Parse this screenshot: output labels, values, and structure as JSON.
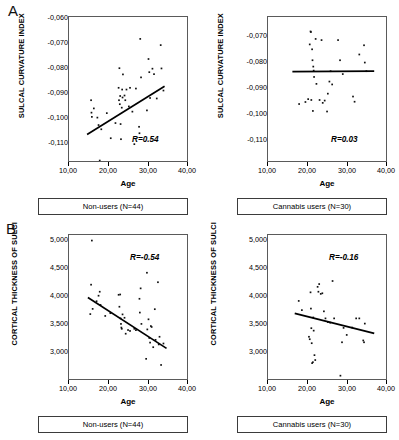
{
  "figure": {
    "panels": [
      {
        "letter": "A",
        "plots": [
          {
            "name": "sulcal-curvature-nonusers",
            "ylabel": "SULCAL CURVATURE INDEX",
            "xlabel": "Age",
            "yticks": [
              "-0,060",
              "-0,070",
              "-0,080",
              "-0,090",
              "-0,100",
              "-0,110"
            ],
            "xticks": [
              "10,00",
              "20,00",
              "30,00",
              "40,00"
            ],
            "r_label": "R=0.54",
            "caption": "Non-users (N=44)"
          },
          {
            "name": "sulcal-curvature-cannabis",
            "ylabel": "SULCAL CURVATURE INDEX",
            "xlabel": "Age",
            "yticks": [
              "-0,070",
              "-0,080",
              "-0,090",
              "-0,100",
              "-0,110"
            ],
            "xticks": [
              "10,00",
              "20,00",
              "30,00",
              "40,00"
            ],
            "r_label": "R=0.03",
            "caption": "Cannabis users (N=30)"
          }
        ]
      },
      {
        "letter": "B",
        "plots": [
          {
            "name": "cortical-thickness-nonusers",
            "ylabel": "CORTICAL THICKNESS OF SULCI",
            "xlabel": "Age",
            "yticks": [
              "5,000",
              "4,500",
              "4,000",
              "3,500",
              "3,000"
            ],
            "xticks": [
              "10,00",
              "20,00",
              "30,00",
              "40,00"
            ],
            "r_label": "R=-0.54",
            "caption": "Non-users (N=44)"
          },
          {
            "name": "cortical-thickness-cannabis",
            "ylabel": "CORTICAL THICKNESS OF SULCI",
            "xlabel": "Age",
            "yticks": [
              "5,000",
              "4,500",
              "4,000",
              "3,500",
              "3,000"
            ],
            "xticks": [
              "10,00",
              "20,00",
              "30,00",
              "40,00"
            ],
            "r_label": "R=-0.16",
            "caption": "Cannabis users (N=30)"
          }
        ]
      }
    ]
  },
  "chart_data": [
    {
      "type": "scatter",
      "id": "A-left",
      "title": "Non-users (N=44)",
      "panel": "A",
      "xlabel": "Age",
      "ylabel": "SULCAL CURVATURE INDEX",
      "xlim": [
        10.0,
        40.0
      ],
      "ylim": [
        -0.115,
        -0.057
      ],
      "xticks": [
        10.0,
        20.0,
        30.0,
        40.0
      ],
      "yticks": [
        -0.06,
        -0.07,
        -0.08,
        -0.09,
        -0.1,
        -0.11
      ],
      "grid": false,
      "legend": null,
      "annotations": [
        "R=0.54"
      ],
      "correlation": 0.54,
      "n": 44,
      "regression_line": {
        "x": [
          14.6,
          34.3
        ],
        "y": [
          -0.1043,
          -0.0849
        ]
      },
      "points": [
        [
          15.6,
          -0.0905
        ],
        [
          15.7,
          -0.0955
        ],
        [
          15.8,
          -0.0972
        ],
        [
          16.3,
          -0.0938
        ],
        [
          17.2,
          -0.0975
        ],
        [
          17.5,
          -0.1005
        ],
        [
          17.8,
          -0.1148
        ],
        [
          18.2,
          -0.1022
        ],
        [
          19.6,
          -0.0957
        ],
        [
          20.6,
          -0.1058
        ],
        [
          21.8,
          -0.0997
        ],
        [
          22.6,
          -0.0855
        ],
        [
          22.7,
          -0.0905
        ],
        [
          22.8,
          -0.0776
        ],
        [
          22.9,
          -0.0921
        ],
        [
          23.0,
          -0.0888
        ],
        [
          23.1,
          -0.1001
        ],
        [
          23.2,
          -0.1062
        ],
        [
          23.4,
          -0.0935
        ],
        [
          23.5,
          -0.0862
        ],
        [
          23.6,
          -0.0894
        ],
        [
          23.7,
          -0.0801
        ],
        [
          24.1,
          -0.0886
        ],
        [
          24.3,
          -0.0905
        ],
        [
          24.6,
          -0.0862
        ],
        [
          25.2,
          -0.093
        ],
        [
          25.5,
          -0.0855
        ],
        [
          26.1,
          -0.0951
        ],
        [
          26.6,
          -0.1082
        ],
        [
          27.0,
          -0.0858
        ],
        [
          27.8,
          -0.1012
        ],
        [
          27.9,
          -0.1038
        ],
        [
          28.1,
          -0.0658
        ],
        [
          28.3,
          -0.0813
        ],
        [
          29.8,
          -0.0946
        ],
        [
          30.2,
          -0.0739
        ],
        [
          30.4,
          -0.0792
        ],
        [
          30.6,
          -0.0896
        ],
        [
          31.2,
          -0.0778
        ],
        [
          31.6,
          -0.08
        ],
        [
          32.3,
          -0.0898
        ],
        [
          33.3,
          -0.0683
        ],
        [
          33.5,
          -0.0777
        ],
        [
          34.0,
          -0.0866
        ]
      ]
    },
    {
      "type": "scatter",
      "id": "A-right",
      "title": "Cannabis users (N=30)",
      "panel": "A",
      "xlabel": "Age",
      "ylabel": "SULCAL CURVATURE INDEX",
      "xlim": [
        10.0,
        40.0
      ],
      "ylim": [
        -0.115,
        -0.065
      ],
      "xticks": [
        10.0,
        20.0,
        30.0,
        40.0
      ],
      "yticks": [
        -0.07,
        -0.08,
        -0.09,
        -0.1,
        -0.11
      ],
      "grid": false,
      "legend": null,
      "annotations": [
        "R=0.03"
      ],
      "correlation": 0.03,
      "n": 30,
      "regression_line": {
        "x": [
          16.2,
          37.0
        ],
        "y": [
          -0.084,
          -0.0838
        ]
      },
      "points": [
        [
          17.9,
          -0.0952
        ],
        [
          19.5,
          -0.0945
        ],
        [
          20.2,
          -0.0935
        ],
        [
          20.6,
          -0.0745
        ],
        [
          20.8,
          -0.07
        ],
        [
          20.9,
          -0.0702
        ],
        [
          21.0,
          -0.0938
        ],
        [
          21.2,
          -0.0762
        ],
        [
          21.3,
          -0.08
        ],
        [
          21.4,
          -0.0976
        ],
        [
          21.5,
          -0.0822
        ],
        [
          21.6,
          -0.0836
        ],
        [
          21.7,
          -0.0858
        ],
        [
          22.1,
          -0.0726
        ],
        [
          22.3,
          -0.0882
        ],
        [
          23.1,
          -0.0938
        ],
        [
          23.6,
          -0.073
        ],
        [
          23.9,
          -0.0948
        ],
        [
          24.4,
          -0.094
        ],
        [
          25.0,
          -0.0978
        ],
        [
          25.2,
          -0.0916
        ],
        [
          25.6,
          -0.0874
        ],
        [
          25.9,
          -0.0838
        ],
        [
          26.3,
          -0.0884
        ],
        [
          27.8,
          -0.073
        ],
        [
          28.3,
          -0.08
        ],
        [
          29.0,
          -0.0848
        ],
        [
          31.6,
          -0.0926
        ],
        [
          32.0,
          -0.0944
        ],
        [
          33.2,
          -0.078
        ],
        [
          34.4,
          -0.0748
        ],
        [
          34.6,
          -0.0808
        ],
        [
          35.0,
          -0.0838
        ]
      ]
    },
    {
      "type": "scatter",
      "id": "B-left",
      "title": "Non-users (N=44)",
      "panel": "B",
      "xlabel": "Age",
      "ylabel": "CORTICAL THICKNESS OF SULCI",
      "xlim": [
        10.0,
        40.0
      ],
      "ylim": [
        2800,
        5150
      ],
      "xticks": [
        10.0,
        20.0,
        30.0,
        40.0
      ],
      "yticks": [
        5000,
        4500,
        4000,
        3500,
        3000
      ],
      "grid": false,
      "legend": null,
      "annotations": [
        "R=-0.54"
      ],
      "correlation": -0.54,
      "n": 44,
      "regression_line": {
        "x": [
          14.8,
          34.8
        ],
        "y": [
          4130,
          3300
        ]
      },
      "points": [
        [
          15.4,
          3860
        ],
        [
          15.6,
          4340
        ],
        [
          15.8,
          5060
        ],
        [
          16.0,
          3945
        ],
        [
          17.0,
          4070
        ],
        [
          17.5,
          4160
        ],
        [
          17.8,
          4225
        ],
        [
          18.0,
          4010
        ],
        [
          19.2,
          3830
        ],
        [
          20.5,
          3875
        ],
        [
          22.6,
          4175
        ],
        [
          22.8,
          3980
        ],
        [
          23.0,
          4180
        ],
        [
          23.1,
          3790
        ],
        [
          23.2,
          3700
        ],
        [
          23.3,
          3640
        ],
        [
          23.4,
          3620
        ],
        [
          23.6,
          3855
        ],
        [
          24.1,
          3800
        ],
        [
          24.4,
          3540
        ],
        [
          25.0,
          3600
        ],
        [
          25.5,
          3585
        ],
        [
          26.6,
          3620
        ],
        [
          27.0,
          3598
        ],
        [
          27.9,
          4110
        ],
        [
          28.0,
          3885
        ],
        [
          28.2,
          4280
        ],
        [
          28.4,
          3700
        ],
        [
          29.6,
          3130
        ],
        [
          29.8,
          4535
        ],
        [
          29.9,
          3610
        ],
        [
          30.2,
          3775
        ],
        [
          30.4,
          3470
        ],
        [
          30.6,
          3395
        ],
        [
          30.8,
          3665
        ],
        [
          31.0,
          3650
        ],
        [
          31.4,
          3320
        ],
        [
          31.8,
          3940
        ],
        [
          32.0,
          3440
        ],
        [
          32.6,
          4380
        ],
        [
          32.8,
          3365
        ],
        [
          33.0,
          3490
        ],
        [
          33.4,
          3030
        ],
        [
          34.0,
          3380
        ]
      ]
    },
    {
      "type": "scatter",
      "id": "B-right",
      "title": "Cannabis users (N=30)",
      "panel": "B",
      "xlabel": "Age",
      "ylabel": "CORTICAL THICKNESS OF SULCI",
      "xlim": [
        10.0,
        40.0
      ],
      "ylim": [
        2800,
        5150
      ],
      "xticks": [
        10.0,
        20.0,
        30.0,
        40.0
      ],
      "yticks": [
        5000,
        4500,
        4000,
        3500,
        3000
      ],
      "grid": false,
      "legend": null,
      "annotations": [
        "R=-0.16"
      ],
      "correlation": -0.16,
      "n": 30,
      "regression_line": {
        "x": [
          16.8,
          37.0
        ],
        "y": [
          3870,
          3545
        ]
      },
      "points": [
        [
          17.8,
          4075
        ],
        [
          18.6,
          3925
        ],
        [
          20.4,
          3490
        ],
        [
          20.6,
          3450
        ],
        [
          20.8,
          4215
        ],
        [
          20.9,
          3950
        ],
        [
          21.0,
          3630
        ],
        [
          21.1,
          3385
        ],
        [
          21.2,
          3060
        ],
        [
          21.4,
          3075
        ],
        [
          21.5,
          3805
        ],
        [
          21.6,
          3590
        ],
        [
          21.8,
          3190
        ],
        [
          22.0,
          3110
        ],
        [
          22.6,
          4305
        ],
        [
          22.8,
          4225
        ],
        [
          23.0,
          4350
        ],
        [
          23.4,
          4190
        ],
        [
          23.8,
          4200
        ],
        [
          24.2,
          3905
        ],
        [
          24.6,
          3790
        ],
        [
          25.2,
          3730
        ],
        [
          25.8,
          3720
        ],
        [
          26.4,
          4400
        ],
        [
          26.8,
          3790
        ],
        [
          28.4,
          2855
        ],
        [
          28.8,
          3400
        ],
        [
          29.2,
          3635
        ],
        [
          30.0,
          3520
        ],
        [
          31.4,
          3640
        ],
        [
          32.4,
          3790
        ],
        [
          33.2,
          3790
        ],
        [
          34.2,
          3430
        ],
        [
          34.4,
          3400
        ],
        [
          34.6,
          3705
        ]
      ]
    }
  ]
}
